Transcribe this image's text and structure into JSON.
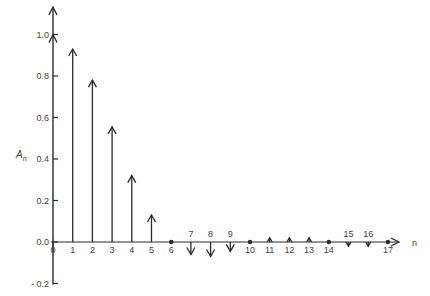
{
  "chart_data": {
    "type": "stem",
    "title": "",
    "xlabel": "n",
    "ylabel": "A_n",
    "ylabel_main": "A",
    "ylabel_sub": "n",
    "x": [
      0,
      1,
      2,
      3,
      4,
      5,
      6,
      7,
      8,
      9,
      10,
      11,
      12,
      13,
      14,
      15,
      16,
      17
    ],
    "values": [
      1.0,
      0.93,
      0.78,
      0.555,
      0.32,
      0.13,
      0.0,
      -0.06,
      -0.07,
      -0.045,
      0.0,
      0.02,
      0.02,
      0.02,
      0.0,
      -0.02,
      -0.02,
      0.0
    ],
    "ylim": [
      -0.2,
      1.0
    ],
    "yticks": [
      -0.2,
      0.0,
      0.2,
      0.4,
      0.6,
      0.8,
      1.0
    ],
    "ytick_labels": [
      "- 0.2",
      "0.0",
      "0.2",
      "0.4",
      "0.6",
      "0.8",
      "1.0"
    ],
    "xtick_labels": [
      "0",
      "1",
      "2",
      "3",
      "4",
      "5",
      "6",
      "7",
      "8",
      "9",
      "10",
      "11",
      "12",
      "13",
      "14",
      "15",
      "16",
      "17"
    ],
    "grid": false,
    "legend": null,
    "marker_style": "arrow for nonzero, dot for zero"
  }
}
